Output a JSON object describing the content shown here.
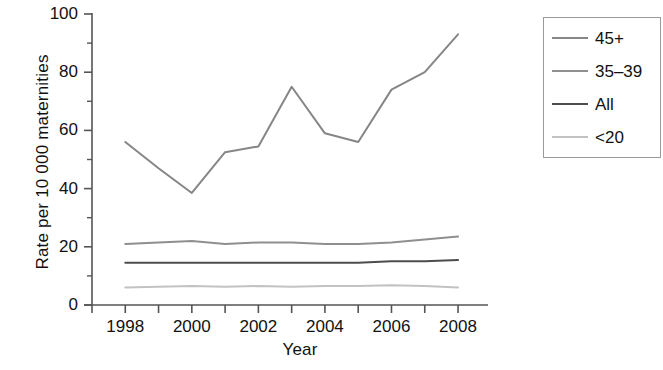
{
  "chart_data": {
    "type": "line",
    "title": "",
    "xlabel": "Year",
    "ylabel": "Rate per 10 000 maternities",
    "x": [
      1998,
      1999,
      2000,
      2001,
      2002,
      2003,
      2004,
      2005,
      2006,
      2007,
      2008
    ],
    "xlim": [
      1997,
      2008.6
    ],
    "ylim": [
      0,
      100
    ],
    "grid": false,
    "legend_position": "right-outside",
    "y_ticks_major": [
      0,
      20,
      40,
      60,
      80,
      100
    ],
    "y_tick_labels": [
      "0",
      "20",
      "40",
      "60",
      "80",
      "100"
    ],
    "y_ticks_minor": [
      10,
      30,
      50,
      70,
      90
    ],
    "x_ticks_major": [
      1997,
      1998,
      1999,
      2000,
      2001,
      2002,
      2003,
      2004,
      2005,
      2006,
      2007,
      2008
    ],
    "x_tick_labels": [
      {
        "value": 1998,
        "label": "1998"
      },
      {
        "value": 2000,
        "label": "2000"
      },
      {
        "value": 2002,
        "label": "2002"
      },
      {
        "value": 2004,
        "label": "2004"
      },
      {
        "value": 2006,
        "label": "2006"
      },
      {
        "value": 2008,
        "label": "2008"
      }
    ],
    "series": [
      {
        "name": "45+",
        "color": "#868686",
        "values": [
          56,
          47,
          38.5,
          52.5,
          54.5,
          75,
          59,
          56,
          74,
          80,
          93
        ]
      },
      {
        "name": "35–39",
        "color": "#8f8f8f",
        "values": [
          21,
          21.5,
          22,
          21,
          21.5,
          21.5,
          21,
          21,
          21.5,
          22.5,
          23.5
        ]
      },
      {
        "name": "All",
        "color": "#4d4d4d",
        "values": [
          14.5,
          14.5,
          14.5,
          14.5,
          14.5,
          14.5,
          14.5,
          14.5,
          15,
          15,
          15.5
        ]
      },
      {
        "name": "<20",
        "color": "#c2c2c2",
        "values": [
          6,
          6.3,
          6.5,
          6.3,
          6.5,
          6.3,
          6.5,
          6.5,
          6.8,
          6.5,
          6
        ]
      }
    ]
  },
  "legend": {
    "entries": [
      {
        "label": "45+",
        "color": "#868686"
      },
      {
        "label": "35–39",
        "color": "#8f8f8f"
      },
      {
        "label": "All",
        "color": "#4d4d4d"
      },
      {
        "label": "<20",
        "color": "#c2c2c2"
      }
    ]
  },
  "axes": {
    "spine_color": "#555555"
  }
}
